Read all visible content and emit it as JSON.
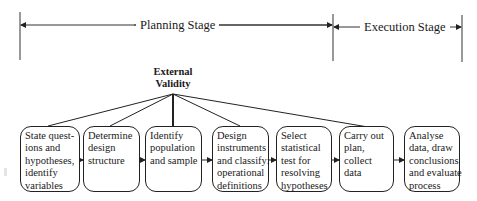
{
  "stages": {
    "planning": "Planning Stage",
    "execution": "Execution Stage"
  },
  "external_validity": {
    "line1": "External",
    "line2": "Validity"
  },
  "steps": [
    {
      "lines": [
        "State quest-",
        "ions and",
        "hypotheses,",
        "identify",
        "variables"
      ]
    },
    {
      "lines": [
        "Determine",
        "design",
        "structure"
      ]
    },
    {
      "lines": [
        "Identify",
        "population",
        "and sample"
      ]
    },
    {
      "lines": [
        "Design",
        "instruments",
        "and classify:",
        "operational",
        "definitions"
      ]
    },
    {
      "lines": [
        "Select",
        "statistical",
        "test for",
        "resolving",
        "hypotheses"
      ]
    },
    {
      "lines": [
        "Carry out",
        "plan,",
        "collect",
        "data"
      ]
    },
    {
      "lines": [
        "Analyse",
        "data, draw",
        "conclusions",
        "and evaluate",
        "process"
      ]
    }
  ],
  "colors": {
    "line": "#222222",
    "background": "#ffffff"
  }
}
